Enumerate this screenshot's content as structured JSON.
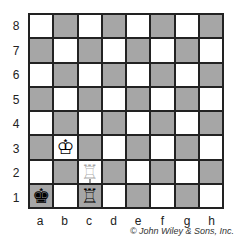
{
  "board": {
    "ranks": [
      "8",
      "7",
      "6",
      "5",
      "4",
      "3",
      "2",
      "1"
    ],
    "files": [
      "a",
      "b",
      "c",
      "d",
      "e",
      "f",
      "g",
      "h"
    ],
    "colors": {
      "light": "#ffffff",
      "dark": "#a6a6a6"
    },
    "pieces": {
      "b3": {
        "name": "white-king",
        "glyph": "♔"
      },
      "a1": {
        "name": "black-king",
        "glyph": "♚"
      },
      "c1": {
        "name": "white-rook",
        "glyph": "♖"
      },
      "c2": {
        "name": "white-rook-ghost",
        "glyph": "♖"
      }
    },
    "move": {
      "from": "c2",
      "to": "c1"
    }
  },
  "copyright": "© John Wiley & Sons, Inc."
}
